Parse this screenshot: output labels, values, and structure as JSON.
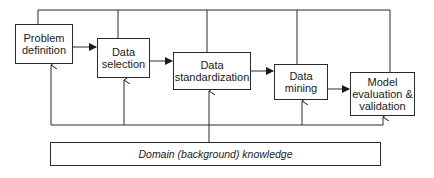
{
  "diagram": {
    "type": "flowchart",
    "nodes": [
      {
        "id": "problem",
        "label": "Problem definition"
      },
      {
        "id": "selection",
        "label": "Data selection"
      },
      {
        "id": "standardization",
        "label": "Data standardization"
      },
      {
        "id": "mining",
        "label": "Data mining"
      },
      {
        "id": "evaluation",
        "label": "Model evaluation & validation"
      },
      {
        "id": "domain",
        "label": "Domain (background) knowledge"
      }
    ],
    "edges": [
      {
        "from": "problem",
        "to": "selection"
      },
      {
        "from": "selection",
        "to": "standardization"
      },
      {
        "from": "standardization",
        "to": "mining"
      },
      {
        "from": "mining",
        "to": "evaluation"
      },
      {
        "from": "all-steps",
        "to": "top-feedback-line",
        "note": "top bus connects every step"
      },
      {
        "from": "domain",
        "to": "all-steps",
        "note": "bottom bus feeds knowledge to every step"
      }
    ],
    "colors": {
      "line": "#2a2a2a",
      "background": "#ffffff"
    }
  }
}
